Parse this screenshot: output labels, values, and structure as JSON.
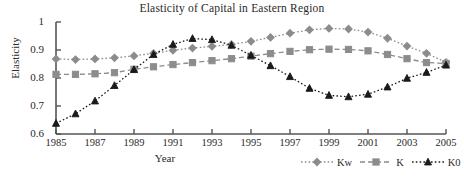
{
  "chart_data": {
    "type": "line",
    "title": "Elasticity of Capital in Eastern Region",
    "xlabel": "Year",
    "ylabel": "Elasticity",
    "xlim": [
      1985,
      2005
    ],
    "ylim": [
      0.6,
      1.0
    ],
    "grid": false,
    "legend_position": "bottom-right",
    "x": [
      1985,
      1986,
      1987,
      1988,
      1989,
      1990,
      1991,
      1992,
      1993,
      1994,
      1995,
      1996,
      1997,
      1998,
      1999,
      2000,
      2001,
      2002,
      2003,
      2004,
      2005
    ],
    "xticks": [
      "1985",
      "1987",
      "1989",
      "1991",
      "1993",
      "1995",
      "1997",
      "1999",
      "2001",
      "2003",
      "2005"
    ],
    "xtick_values": [
      1985,
      1987,
      1989,
      1991,
      1993,
      1995,
      1997,
      1999,
      2001,
      2003,
      2005
    ],
    "yticks": [
      "0.6",
      "0.7",
      "0.8",
      "0.9",
      "1"
    ],
    "ytick_values": [
      0.6,
      0.7,
      0.8,
      0.9,
      1.0
    ],
    "series": [
      {
        "name": "Kw",
        "marker": "diamond",
        "linestyle": "dotted",
        "color": "#8c8c8c",
        "values": [
          0.868,
          0.866,
          0.868,
          0.872,
          0.879,
          0.888,
          0.899,
          0.907,
          0.913,
          0.92,
          0.931,
          0.945,
          0.96,
          0.972,
          0.977,
          0.975,
          0.964,
          0.942,
          0.914,
          0.888,
          0.856
        ]
      },
      {
        "name": "K",
        "marker": "square",
        "linestyle": "dashed",
        "color": "#8c8c8c",
        "values": [
          0.813,
          0.813,
          0.815,
          0.819,
          0.831,
          0.84,
          0.848,
          0.855,
          0.862,
          0.869,
          0.878,
          0.887,
          0.895,
          0.901,
          0.903,
          0.902,
          0.897,
          0.884,
          0.869,
          0.855,
          0.852
        ]
      },
      {
        "name": "K0",
        "marker": "triangle",
        "linestyle": "dotted",
        "color": "#1a1a1a",
        "values": [
          0.638,
          0.672,
          0.718,
          0.773,
          0.83,
          0.884,
          0.92,
          0.941,
          0.937,
          0.917,
          0.881,
          0.844,
          0.805,
          0.763,
          0.738,
          0.733,
          0.742,
          0.768,
          0.799,
          0.82,
          0.846
        ]
      }
    ]
  }
}
